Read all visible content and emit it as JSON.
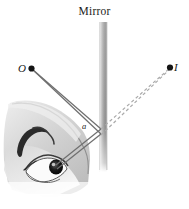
{
  "figure": {
    "title_label": "Mirror",
    "object_label": "O",
    "image_label": "I",
    "angle_label": "a",
    "colors": {
      "background": "#ffffff",
      "mirror_light": "#e8e8e8",
      "mirror_dark": "#8d8d8d",
      "ray_solid": "#6e6e6e",
      "ray_dashed": "#a9a9a9",
      "dot": "#141414",
      "skin_light": "#e2e2e2",
      "skin_mid": "#c9c9c9",
      "skin_dark": "#9a9a9a",
      "brow": "#2a2a2a",
      "pupil": "#111111",
      "sclera": "#fdfdfd",
      "text": "#1a1a1a"
    },
    "geometry": {
      "mirror_x": 103,
      "mirror_top_y": 22,
      "mirror_bottom_y": 172,
      "mirror_width": 7,
      "object_point": [
        31,
        68
      ],
      "image_point": [
        170,
        67
      ],
      "reflection_point": [
        101,
        130
      ],
      "eye_point": [
        52,
        166
      ]
    },
    "elements": {
      "mirror_bar_name": "mirror-bar",
      "object_dot_name": "object-point-dot",
      "image_dot_name": "image-point-dot",
      "incident_rays_name": "incident-rays",
      "reflected_rays_name": "reflected-rays",
      "virtual_rays_name": "virtual-dashed-rays",
      "face_name": "face-illustration",
      "eye_name": "eye-illustration"
    }
  }
}
